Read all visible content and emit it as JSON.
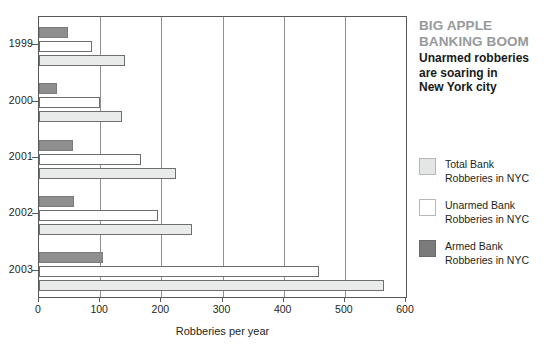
{
  "headline": {
    "line1": "BIG APPLE",
    "line2": "BANKING BOOM"
  },
  "subhead": {
    "line1": "Unarmed robberies",
    "line2": "are soaring in",
    "line3": "New York city"
  },
  "legend": {
    "items": [
      {
        "key": "total",
        "label_line1": "Total Bank",
        "label_line2": "Robberies in NYC",
        "color": "#e4e5e5"
      },
      {
        "key": "unarmed",
        "label_line1": "Unarmed Bank",
        "label_line2": "Robberies in NYC",
        "color": "#ffffff"
      },
      {
        "key": "armed",
        "label_line1": "Armed Bank",
        "label_line2": "Robberies in NYC",
        "color": "#7b7b7b"
      }
    ]
  },
  "chart_data": {
    "type": "bar",
    "orientation": "horizontal",
    "title": "BIG APPLE BANKING BOOM",
    "subtitle": "Unarmed robberies are soaring in New York city",
    "xlabel": "Robberies per year",
    "ylabel": "",
    "xlim": [
      0,
      600
    ],
    "xticks": [
      0,
      100,
      200,
      300,
      400,
      500,
      600
    ],
    "xticklabels": [
      "0",
      "100",
      "200",
      "300",
      "400",
      "500",
      "600"
    ],
    "categories": [
      "1999",
      "2000",
      "2001",
      "2002",
      "2003"
    ],
    "grid": "vertical",
    "legend_position": "right",
    "series": [
      {
        "name": "Armed Bank Robberies in NYC",
        "key": "armed",
        "color": "#8e8e8e",
        "values": [
          48,
          30,
          55,
          58,
          104
        ]
      },
      {
        "name": "Unarmed Bank Robberies in NYC",
        "key": "unarmed",
        "color": "#ffffff",
        "values": [
          86,
          100,
          167,
          195,
          457
        ]
      },
      {
        "name": "Total Bank Robberies in NYC",
        "key": "total",
        "color": "#e9eaea",
        "values": [
          140,
          136,
          224,
          250,
          564
        ]
      }
    ]
  }
}
